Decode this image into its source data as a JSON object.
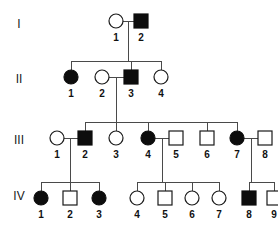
{
  "figure": {
    "kind": "pedigree-chart",
    "background_color": "#ffffff",
    "line_color": "#4a4a4a",
    "symbol_stroke_color": "#1a1a1a",
    "affected_fill_color": "#0d0d0d",
    "unaffected_fill_color": "#ffffff",
    "label_color": "#111111"
  },
  "generation_labels": [
    {
      "text": "I",
      "x": 19,
      "y": 25
    },
    {
      "text": "II",
      "x": 19,
      "y": 80
    },
    {
      "text": "III",
      "x": 19,
      "y": 141
    },
    {
      "text": "IV",
      "x": 19,
      "y": 197
    }
  ],
  "individuals": [
    {
      "id": "I-1",
      "number": "1",
      "generation": "I",
      "sex": "female",
      "shape": "circle",
      "affected": false,
      "cx": 116,
      "cy": 21,
      "label_x": 116,
      "label_y": 38
    },
    {
      "id": "I-2",
      "number": "2",
      "generation": "I",
      "sex": "male",
      "shape": "square",
      "affected": true,
      "cx": 141,
      "cy": 21,
      "label_x": 141,
      "label_y": 38
    },
    {
      "id": "II-1",
      "number": "1",
      "generation": "II",
      "sex": "female",
      "shape": "circle",
      "affected": true,
      "cx": 71,
      "cy": 77,
      "label_x": 71,
      "label_y": 94
    },
    {
      "id": "II-2",
      "number": "2",
      "generation": "II",
      "sex": "female",
      "shape": "circle",
      "affected": false,
      "cx": 102,
      "cy": 77,
      "label_x": 102,
      "label_y": 94
    },
    {
      "id": "II-3",
      "number": "3",
      "generation": "II",
      "sex": "male",
      "shape": "square",
      "affected": true,
      "cx": 131,
      "cy": 77,
      "label_x": 131,
      "label_y": 94
    },
    {
      "id": "II-4",
      "number": "4",
      "generation": "II",
      "sex": "female",
      "shape": "circle",
      "affected": false,
      "cx": 161,
      "cy": 77,
      "label_x": 161,
      "label_y": 94
    },
    {
      "id": "III-1",
      "number": "1",
      "generation": "III",
      "sex": "female",
      "shape": "circle",
      "affected": false,
      "cx": 57,
      "cy": 138,
      "label_x": 57,
      "label_y": 155
    },
    {
      "id": "III-2",
      "number": "2",
      "generation": "III",
      "sex": "male",
      "shape": "square",
      "affected": true,
      "cx": 85,
      "cy": 138,
      "label_x": 85,
      "label_y": 155
    },
    {
      "id": "III-3",
      "number": "3",
      "generation": "III",
      "sex": "female",
      "shape": "circle",
      "affected": false,
      "cx": 116,
      "cy": 138,
      "label_x": 116,
      "label_y": 155
    },
    {
      "id": "III-4",
      "number": "4",
      "generation": "III",
      "sex": "female",
      "shape": "circle",
      "affected": true,
      "cx": 148,
      "cy": 138,
      "label_x": 148,
      "label_y": 155
    },
    {
      "id": "III-5",
      "number": "5",
      "generation": "III",
      "sex": "male",
      "shape": "square",
      "affected": false,
      "cx": 176,
      "cy": 138,
      "label_x": 176,
      "label_y": 155
    },
    {
      "id": "III-6",
      "number": "6",
      "generation": "III",
      "sex": "male",
      "shape": "square",
      "affected": false,
      "cx": 207,
      "cy": 138,
      "label_x": 207,
      "label_y": 155
    },
    {
      "id": "III-7",
      "number": "7",
      "generation": "III",
      "sex": "female",
      "shape": "circle",
      "affected": true,
      "cx": 237,
      "cy": 138,
      "label_x": 237,
      "label_y": 155
    },
    {
      "id": "III-8",
      "number": "8",
      "generation": "III",
      "sex": "male",
      "shape": "square",
      "affected": false,
      "cx": 265,
      "cy": 138,
      "label_x": 265,
      "label_y": 155
    },
    {
      "id": "IV-1",
      "number": "1",
      "generation": "IV",
      "sex": "female",
      "shape": "circle",
      "affected": true,
      "cx": 41,
      "cy": 198,
      "label_x": 41,
      "label_y": 215
    },
    {
      "id": "IV-2",
      "number": "2",
      "generation": "IV",
      "sex": "male",
      "shape": "square",
      "affected": false,
      "cx": 70,
      "cy": 198,
      "label_x": 70,
      "label_y": 215
    },
    {
      "id": "IV-3",
      "number": "3",
      "generation": "IV",
      "sex": "female",
      "shape": "circle",
      "affected": true,
      "cx": 99,
      "cy": 198,
      "label_x": 99,
      "label_y": 215
    },
    {
      "id": "IV-4",
      "number": "4",
      "generation": "IV",
      "sex": "female",
      "shape": "circle",
      "affected": false,
      "cx": 137,
      "cy": 198,
      "label_x": 137,
      "label_y": 215
    },
    {
      "id": "IV-5",
      "number": "5",
      "generation": "IV",
      "sex": "male",
      "shape": "square",
      "affected": false,
      "cx": 165,
      "cy": 198,
      "label_x": 165,
      "label_y": 215
    },
    {
      "id": "IV-6",
      "number": "6",
      "generation": "IV",
      "sex": "female",
      "shape": "circle",
      "affected": false,
      "cx": 192,
      "cy": 198,
      "label_x": 192,
      "label_y": 215
    },
    {
      "id": "IV-7",
      "number": "7",
      "generation": "IV",
      "sex": "female",
      "shape": "circle",
      "affected": false,
      "cx": 219,
      "cy": 198,
      "label_x": 219,
      "label_y": 215
    },
    {
      "id": "IV-8",
      "number": "8",
      "generation": "IV",
      "sex": "male",
      "shape": "square",
      "affected": true,
      "cx": 249,
      "cy": 198,
      "label_x": 249,
      "label_y": 215
    },
    {
      "id": "IV-9",
      "number": "9",
      "generation": "IV",
      "sex": "male",
      "shape": "square",
      "affected": false,
      "cx": 274,
      "cy": 198,
      "label_x": 274,
      "label_y": 215
    }
  ],
  "mating_lines": [
    {
      "name": "mating-I1-I2",
      "x1": 123,
      "y1": 21,
      "x2": 134,
      "y2": 21
    },
    {
      "name": "mating-II2-II3",
      "x1": 109,
      "y1": 77,
      "x2": 124,
      "y2": 77
    },
    {
      "name": "mating-III1-III2",
      "x1": 64,
      "y1": 138,
      "x2": 78,
      "y2": 138
    },
    {
      "name": "mating-III4-III5",
      "x1": 155,
      "y1": 138,
      "x2": 169,
      "y2": 138
    },
    {
      "name": "mating-III7-III8",
      "x1": 244,
      "y1": 138,
      "x2": 258,
      "y2": 138
    }
  ],
  "descent_lines": [
    {
      "name": "descent-I-to-II",
      "x1": 128,
      "y1": 21,
      "x2": 128,
      "y2": 61
    },
    {
      "name": "descent-II-to-III",
      "x1": 116,
      "y1": 77,
      "x2": 116,
      "y2": 122
    },
    {
      "name": "descent-III2-to-IV-left",
      "x1": 70,
      "y1": 138,
      "x2": 70,
      "y2": 182
    },
    {
      "name": "descent-III4-to-IV-mid",
      "x1": 162,
      "y1": 138,
      "x2": 162,
      "y2": 182
    },
    {
      "name": "descent-III7-to-IV-right",
      "x1": 251,
      "y1": 138,
      "x2": 251,
      "y2": 182
    }
  ],
  "sibship_bars": [
    {
      "name": "sibship-bar-II",
      "x1": 71,
      "x2": 161,
      "y": 61
    },
    {
      "name": "sibship-bar-III",
      "x1": 85,
      "x2": 237,
      "y": 122
    },
    {
      "name": "sibship-bar-IV-left",
      "x1": 41,
      "x2": 99,
      "y": 182
    },
    {
      "name": "sibship-bar-IV-mid",
      "x1": 137,
      "x2": 219,
      "y": 182
    },
    {
      "name": "sibship-bar-IV-right",
      "x1": 249,
      "x2": 274,
      "y": 182
    }
  ],
  "sibling_drops": [
    {
      "name": "drop-II-1",
      "x": 71,
      "y1": 61,
      "y2": 70
    },
    {
      "name": "drop-II-3",
      "x": 131,
      "y1": 61,
      "y2": 70
    },
    {
      "name": "drop-II-4",
      "x": 161,
      "y1": 61,
      "y2": 70
    },
    {
      "name": "drop-III-2",
      "x": 85,
      "y1": 122,
      "y2": 131
    },
    {
      "name": "drop-III-3",
      "x": 116,
      "y1": 122,
      "y2": 131
    },
    {
      "name": "drop-III-4",
      "x": 148,
      "y1": 122,
      "y2": 131
    },
    {
      "name": "drop-III-6",
      "x": 207,
      "y1": 122,
      "y2": 131
    },
    {
      "name": "drop-III-7",
      "x": 237,
      "y1": 122,
      "y2": 131
    },
    {
      "name": "drop-IV-1",
      "x": 41,
      "y1": 182,
      "y2": 191
    },
    {
      "name": "drop-IV-2",
      "x": 70,
      "y1": 182,
      "y2": 191
    },
    {
      "name": "drop-IV-3",
      "x": 99,
      "y1": 182,
      "y2": 191
    },
    {
      "name": "drop-IV-4",
      "x": 137,
      "y1": 182,
      "y2": 191
    },
    {
      "name": "drop-IV-5",
      "x": 165,
      "y1": 182,
      "y2": 191
    },
    {
      "name": "drop-IV-6",
      "x": 192,
      "y1": 182,
      "y2": 191
    },
    {
      "name": "drop-IV-7",
      "x": 219,
      "y1": 182,
      "y2": 191
    },
    {
      "name": "drop-IV-8",
      "x": 249,
      "y1": 182,
      "y2": 191
    },
    {
      "name": "drop-IV-9",
      "x": 274,
      "y1": 182,
      "y2": 191
    }
  ],
  "geometry": {
    "circle_radius": 7,
    "square_size": 14
  }
}
